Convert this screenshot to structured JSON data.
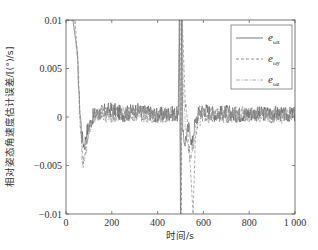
{
  "chart_data": {
    "type": "line",
    "title": "",
    "xlabel": "时间/s",
    "ylabel": "相对姿态角速度估计误差/[(°)/s]",
    "xlim": [
      0,
      1000
    ],
    "ylim": [
      -0.01,
      0.01
    ],
    "x_ticks": [
      0,
      200,
      400,
      600,
      800,
      1000
    ],
    "x_tick_labels": [
      "0",
      "200",
      "400",
      "600",
      "800",
      "1 000"
    ],
    "y_ticks": [
      -0.01,
      -0.005,
      0,
      0.005,
      0.01
    ],
    "y_tick_labels": [
      "-0.01",
      "-0.005",
      "0",
      "0.005",
      "0.01"
    ],
    "grid": false,
    "legend_position": "upper right",
    "series": [
      {
        "name": "e_ωx",
        "label_main": "e",
        "label_sub": "ωx",
        "line_style": "solid",
        "color": "#555555",
        "x": [
          0,
          3,
          6,
          30,
          50,
          60,
          70,
          80,
          90,
          100,
          120,
          150,
          200,
          250,
          300,
          350,
          400,
          450,
          490,
          495,
          500,
          505,
          510,
          520,
          530,
          540,
          550,
          560,
          580,
          600,
          650,
          700,
          750,
          800,
          850,
          900,
          950,
          1000
        ],
        "values": [
          0.01,
          0.01,
          0.01,
          0.01,
          0.006,
          0.001,
          -0.002,
          -0.003,
          -0.0015,
          -0.001,
          0.0002,
          0.0005,
          0.0008,
          0.0003,
          0.0007,
          0.0005,
          0.0002,
          0.0004,
          0.0003,
          0.01,
          -0.01,
          0.01,
          -0.002,
          -0.0025,
          -0.0015,
          -0.001,
          -0.003,
          -0.001,
          0.0005,
          0.0008,
          0.0003,
          0.0005,
          0.0002,
          0.0004,
          0.0003,
          0.0005,
          0.0002,
          0.0003
        ]
      },
      {
        "name": "e_ωy",
        "label_main": "e",
        "label_sub": "ωy",
        "line_style": "dashed",
        "color": "#777777",
        "x": [
          0,
          3,
          40,
          55,
          65,
          75,
          85,
          95,
          110,
          130,
          160,
          200,
          250,
          300,
          350,
          400,
          450,
          490,
          498,
          503,
          508,
          520,
          535,
          545,
          555,
          565,
          580,
          600,
          650,
          700,
          750,
          800,
          850,
          900,
          950,
          1000
        ],
        "values": [
          0.01,
          0.01,
          0.01,
          0.004,
          -0.002,
          -0.0045,
          -0.003,
          -0.0015,
          -0.0005,
          0.0002,
          0.0004,
          0.0003,
          0.0001,
          0.0005,
          0.0002,
          0.0001,
          0.0003,
          0.0002,
          0.01,
          -0.01,
          0.01,
          0.002,
          -0.002,
          -0.006,
          -0.01,
          -0.002,
          0.0004,
          0.0002,
          0.0003,
          0.0001,
          0.0004,
          0.0002,
          0.0003,
          0.0001,
          0.0004,
          0.0002
        ]
      },
      {
        "name": "e_ωz",
        "label_main": "e",
        "label_sub": "ωz",
        "line_style": "dash-dot",
        "color": "#999999",
        "x": [
          0,
          3,
          35,
          50,
          60,
          70,
          80,
          90,
          100,
          120,
          150,
          200,
          250,
          300,
          350,
          400,
          450,
          490,
          496,
          501,
          506,
          515,
          525,
          535,
          545,
          555,
          570,
          600,
          650,
          700,
          750,
          800,
          850,
          900,
          950,
          1000
        ],
        "values": [
          0.01,
          0.01,
          0.01,
          0.005,
          0.0,
          -0.004,
          -0.005,
          -0.003,
          -0.0012,
          -0.0003,
          0.0002,
          0.0001,
          0.0004,
          0.0002,
          0.0003,
          0.0001,
          0.0002,
          0.0001,
          0.01,
          -0.01,
          0.01,
          0.001,
          -0.002,
          -0.0035,
          -0.004,
          -0.003,
          -0.0005,
          0.0002,
          0.0001,
          0.0003,
          0.0001,
          0.0002,
          0.0001,
          0.0003,
          0.0001,
          0.0002
        ]
      }
    ],
    "noise_amplitude": 0.001
  }
}
